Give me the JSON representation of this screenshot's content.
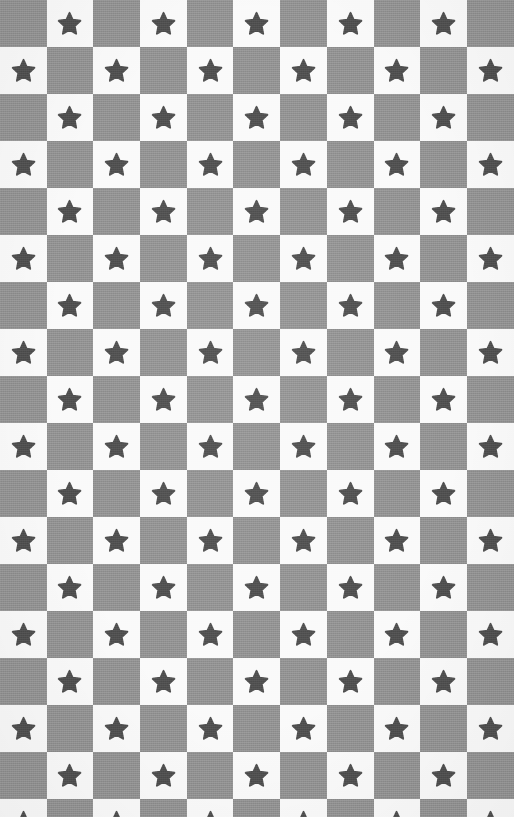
{
  "image": {
    "title": "Star Checkerboard Fabric Pattern",
    "kind": "seamless-textile-swatch",
    "width_px": 514,
    "height_px": 817,
    "description": "Close-up photograph of woven cotton fabric printed with a checkerboard of gray and white squares; every white square carries a single rounded five-pointed dark-gray star."
  },
  "palette": {
    "dark_square": "#919191",
    "light_square": "#fafafa",
    "star_fill": "#4f4f4f",
    "background": "#ffffff"
  },
  "grid": {
    "columns": 11,
    "rows": 18,
    "cell_width_px": 46.7,
    "cell_height_px": 47.0,
    "first_cell_color": "dark",
    "star_on_color": "light",
    "star_points": 5,
    "star_scale_percent": 58,
    "star_corner_style": "rounded"
  },
  "motif": {
    "name": "star",
    "icon": "star-icon",
    "count_visible": 99
  },
  "texture": {
    "weave_visible": true,
    "weave_opacity": 0.14,
    "noise_style": "plain-weave-cotton"
  }
}
